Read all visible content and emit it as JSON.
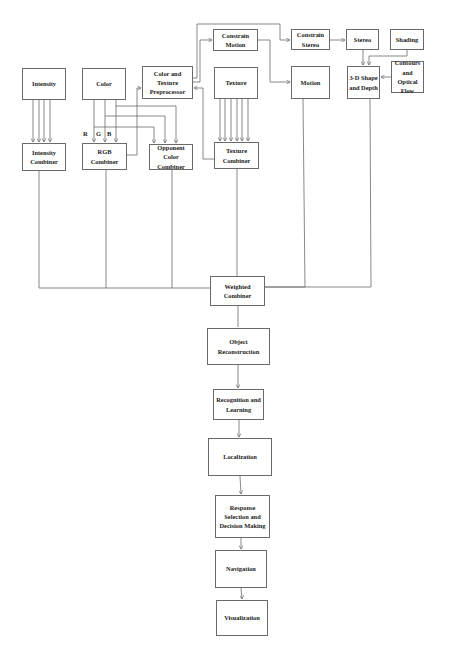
{
  "diagram": {
    "type": "flowchart",
    "nodes": {
      "intensity": {
        "label": "Intensity",
        "box": [
          22,
          68,
          44,
          32
        ]
      },
      "color": {
        "label": "Color",
        "box": [
          82,
          68,
          44,
          32
        ]
      },
      "preprocessor": {
        "label": "Color and Texture Preprocessor",
        "box": [
          142,
          66,
          51,
          33
        ]
      },
      "constrain_motion": {
        "label": "Constrain Motion",
        "box": [
          213,
          29,
          45,
          22
        ]
      },
      "texture": {
        "label": "Texture",
        "box": [
          214,
          67,
          44,
          32
        ]
      },
      "constrain_stereo": {
        "label": "Constrain Stereo",
        "box": [
          291,
          29,
          39,
          21
        ]
      },
      "stereo": {
        "label": "Stereo",
        "box": [
          346,
          29,
          33,
          21
        ]
      },
      "shading": {
        "label": "Shading",
        "box": [
          390,
          29,
          34,
          21
        ]
      },
      "motion": {
        "label": "Motion",
        "box": [
          291,
          66,
          39,
          33
        ]
      },
      "shape_depth": {
        "label": "3-D Shape and Depth",
        "box": [
          347,
          66,
          33,
          33
        ]
      },
      "contours": {
        "label": "Contours and Optical Flow",
        "box": [
          391,
          61,
          33,
          32
        ]
      },
      "intensity_combiner": {
        "label": "Intensity Combiner",
        "box": [
          22,
          143,
          44,
          28
        ]
      },
      "rgb_combiner": {
        "label": "RGB Combiner",
        "box": [
          82,
          143,
          45,
          27
        ]
      },
      "opponent_combiner": {
        "label": "Opponent Color Combiner",
        "box": [
          149,
          144,
          44,
          26
        ]
      },
      "texture_combiner": {
        "label": "Texture Combiner",
        "box": [
          214,
          142,
          45,
          27
        ]
      },
      "weighted_combiner": {
        "label": "Weighted Combiner",
        "box": [
          210,
          276,
          55,
          30
        ]
      },
      "object_reconstruction": {
        "label": "Object Reconstruction",
        "box": [
          207,
          328,
          63,
          37
        ]
      },
      "recognition": {
        "label": "Recognition and Learning",
        "box": [
          213,
          389,
          51,
          31
        ]
      },
      "localization": {
        "label": "Localization",
        "box": [
          208,
          438,
          64,
          38
        ]
      },
      "response": {
        "label": "Response Selection and Decision Making",
        "box": [
          215,
          495,
          55,
          43
        ]
      },
      "navigation": {
        "label": "Navigation",
        "box": [
          215,
          550,
          52,
          38
        ]
      },
      "visualization": {
        "label": "Visualization",
        "box": [
          216,
          600,
          52,
          36
        ]
      }
    },
    "channel_labels": {
      "r": "R",
      "g": "G",
      "b": "B"
    },
    "edges": [
      {
        "from": "intensity",
        "to": "intensity_combiner",
        "count": 4
      },
      {
        "from": "color",
        "to": "rgb_combiner",
        "label": "R/G/B",
        "count": 3
      },
      {
        "from": "color",
        "to": "opponent_combiner",
        "count": 3
      },
      {
        "from": "rgb_combiner",
        "to": "preprocessor"
      },
      {
        "from": "texture_combiner",
        "to": "preprocessor"
      },
      {
        "from": "texture",
        "to": "texture_combiner",
        "count": 6
      },
      {
        "from": "preprocessor",
        "to": "constrain_motion"
      },
      {
        "from": "preprocessor",
        "to": "constrain_stereo"
      },
      {
        "from": "constrain_motion",
        "to": "motion"
      },
      {
        "from": "constrain_stereo",
        "to": "stereo"
      },
      {
        "from": "stereo",
        "to": "shape_depth"
      },
      {
        "from": "shading",
        "to": "shape_depth"
      },
      {
        "from": "contours",
        "to": "shape_depth"
      },
      {
        "from": "intensity_combiner",
        "to": "weighted_combiner"
      },
      {
        "from": "rgb_combiner",
        "to": "weighted_combiner"
      },
      {
        "from": "opponent_combiner",
        "to": "weighted_combiner"
      },
      {
        "from": "texture_combiner",
        "to": "weighted_combiner"
      },
      {
        "from": "motion",
        "to": "weighted_combiner"
      },
      {
        "from": "shape_depth",
        "to": "weighted_combiner"
      },
      {
        "from": "weighted_combiner",
        "to": "object_reconstruction"
      },
      {
        "from": "object_reconstruction",
        "to": "recognition"
      },
      {
        "from": "recognition",
        "to": "localization"
      },
      {
        "from": "localization",
        "to": "response"
      },
      {
        "from": "response",
        "to": "navigation"
      },
      {
        "from": "navigation",
        "to": "visualization"
      }
    ],
    "colors": {
      "line": "#6a6a6a",
      "text": "#222222",
      "background": "#ffffff"
    }
  }
}
